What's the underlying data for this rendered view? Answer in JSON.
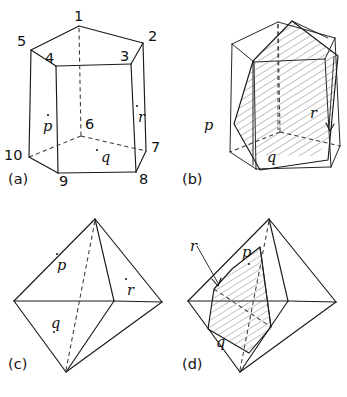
{
  "figure": {
    "width": 347,
    "height": 397,
    "ink_color": "#1a1a1a",
    "background_color": "#ffffff",
    "hatch_color": "#555555"
  },
  "panels": [
    {
      "id": "a",
      "caption": "(a)",
      "solid": "pentagonal prism",
      "vertex_labels": [
        "1",
        "2",
        "3",
        "4",
        "5",
        "6",
        "7",
        "8",
        "9",
        "10"
      ],
      "face_labels": [
        "p",
        "q",
        "r"
      ]
    },
    {
      "id": "b",
      "caption": "(b)",
      "solid": "pentagonal prism with cutting plane",
      "vertex_labels": [],
      "face_labels": [
        "p",
        "q",
        "r"
      ]
    },
    {
      "id": "c",
      "caption": "(c)",
      "solid": "octahedron",
      "vertex_labels": [],
      "face_labels": [
        "p",
        "q",
        "r"
      ]
    },
    {
      "id": "d",
      "caption": "(d)",
      "solid": "octahedron with cutting plane",
      "vertex_labels": [],
      "face_labels": [
        "p",
        "q",
        "r"
      ]
    }
  ],
  "panel_a": {
    "caption": "(a)",
    "labels": {
      "v1": "1",
      "v2": "2",
      "v3": "3",
      "v4": "4",
      "v5": "5",
      "v6": "6",
      "v7": "7",
      "v8": "8",
      "v9": "9",
      "v10": "10",
      "p": "p",
      "q": "q",
      "r": "r"
    }
  },
  "panel_b": {
    "caption": "(b)",
    "labels": {
      "p": "p",
      "q": "q",
      "r": "r"
    }
  },
  "panel_c": {
    "caption": "(c)",
    "labels": {
      "p": "p",
      "q": "q",
      "r": "r"
    }
  },
  "panel_d": {
    "caption": "(d)",
    "labels": {
      "p": "p",
      "q": "q",
      "r": "r"
    }
  }
}
